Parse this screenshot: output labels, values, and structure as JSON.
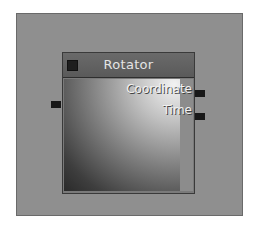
{
  "node": {
    "title": "Rotator",
    "inputs": [
      {
        "name": "input-port"
      }
    ],
    "outputs": [
      {
        "label": "Coordinate"
      },
      {
        "label": "Time"
      }
    ]
  },
  "colors": {
    "canvas": "#8f8f8f",
    "header": "#5e5e5e",
    "port": "#181818",
    "label": "#f0f0f0"
  }
}
